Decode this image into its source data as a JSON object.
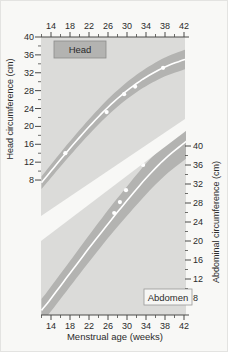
{
  "figure": {
    "name": "fetal-growth-chart",
    "xlabel": "Menstrual age (weeks)"
  },
  "chart_data": {
    "type": "area",
    "title": "",
    "xlabel": "Menstrual age (weeks)",
    "x_ticks": [
      14,
      18,
      22,
      26,
      30,
      34,
      38,
      42
    ],
    "x_minor_ticks": [
      12,
      16,
      20,
      24,
      28,
      32,
      36,
      40
    ],
    "xlim": [
      11.8,
      43.5
    ],
    "grid": false,
    "legend_position": "none",
    "panels": [
      {
        "id": "head",
        "label": "Head",
        "axis_side": "left",
        "ylabel": "Head circumference (cm)",
        "y_ticks": [
          40,
          36,
          32,
          28,
          24,
          20,
          16,
          12,
          8
        ],
        "y_minor_ticks": [
          38,
          34,
          30,
          26,
          22,
          18,
          14,
          10
        ],
        "ylim": [
          8,
          40
        ],
        "weeks": [
          12,
          14,
          18,
          22,
          26,
          30,
          34,
          38,
          42,
          43.5
        ],
        "p90": [
          8.8,
          11.5,
          16.7,
          21.6,
          26.1,
          29.9,
          33.0,
          35.4,
          37.1,
          37.5
        ],
        "p50": [
          7.4,
          10.0,
          15.1,
          19.9,
          24.3,
          28.0,
          31.0,
          33.3,
          34.9,
          35.3
        ],
        "p10": [
          6.0,
          8.5,
          13.5,
          18.2,
          22.5,
          26.1,
          29.0,
          31.2,
          32.7,
          33.1
        ],
        "patient_points": [
          [
            17.0,
            14.0
          ],
          [
            25.7,
            23.2
          ],
          [
            29.4,
            27.2
          ],
          [
            31.7,
            28.9
          ],
          [
            37.6,
            33.1
          ]
        ]
      },
      {
        "id": "abdomen",
        "label": "Abdomen",
        "axis_side": "right",
        "ylabel": "Abdominal circumference (cm)",
        "y_ticks": [
          40,
          36,
          32,
          28,
          24,
          20,
          16,
          12,
          8
        ],
        "y_minor_ticks": [
          38,
          34,
          30,
          26,
          22,
          18,
          14,
          10
        ],
        "ylim": [
          8,
          40
        ],
        "weeks": [
          12,
          14,
          18,
          22,
          26,
          30,
          34,
          38,
          42,
          43.5
        ],
        "p90": [
          7.8,
          10.4,
          15.8,
          21.2,
          26.5,
          31.5,
          36.3,
          40.3,
          43.5,
          44.5
        ],
        "p50": [
          5.4,
          7.9,
          13.2,
          18.5,
          23.6,
          28.5,
          33.2,
          37.3,
          40.6,
          41.7
        ],
        "p10": [
          2.8,
          5.2,
          10.4,
          15.6,
          20.6,
          25.3,
          29.8,
          33.8,
          37.0,
          38.1
        ],
        "patient_points": [
          [
            27.3,
            25.9
          ],
          [
            28.5,
            28.2
          ],
          [
            29.8,
            30.7
          ],
          [
            33.4,
            36.0
          ],
          [
            36.9,
            40.4
          ]
        ]
      }
    ],
    "colors": {
      "figure_bg": "#f8f8f6",
      "panel_bg": "#dbdbd9",
      "band": "#b3b3b1",
      "median_line": "#ffffff",
      "point": "#ffffff",
      "text": "#2b2b2b",
      "tick": "#4a4a48",
      "head_label_bg": "#b3b3b1",
      "head_label_border": "#8c8c8a",
      "abdomen_label_bg": "#f6f6f4",
      "abdomen_label_border": "#9a9a98"
    }
  }
}
